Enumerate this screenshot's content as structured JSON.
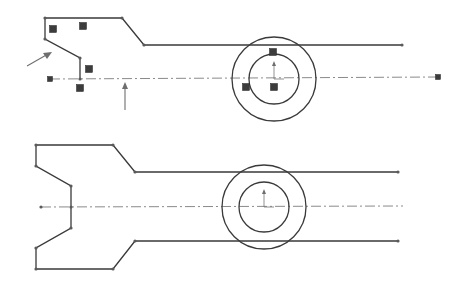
{
  "figure": {
    "colors": {
      "background": "#ffffff",
      "geometry": "#3a3a3a",
      "centerline": "#8a8a8a",
      "relation_badge": "#3c3c3c",
      "annotation_arrow": "#6e6e6e"
    },
    "top_sketch": {
      "polyline": [
        [
          45,
          18
        ],
        [
          122,
          18
        ],
        [
          144,
          45
        ],
        [
          402,
          45
        ]
      ],
      "left_chain": [
        [
          45,
          18
        ],
        [
          45,
          39
        ],
        [
          80,
          58
        ],
        [
          80,
          79
        ]
      ],
      "centerline": {
        "from": [
          50,
          79
        ],
        "to": [
          438,
          77
        ]
      },
      "circles": [
        {
          "cx": 274,
          "cy": 79,
          "r": 42
        },
        {
          "cx": 274,
          "cy": 79,
          "r": 25
        }
      ],
      "relation_badges": [
        [
          53,
          29
        ],
        [
          83,
          26
        ],
        [
          89,
          69
        ],
        [
          80,
          88
        ],
        [
          273,
          52
        ],
        [
          246,
          87
        ],
        [
          274,
          87
        ]
      ],
      "endpoint_squares": [
        [
          50,
          79
        ],
        [
          438,
          77
        ]
      ],
      "arrows": [
        {
          "from": [
            27,
            66
          ],
          "to": [
            50,
            53
          ]
        },
        {
          "from": [
            125,
            110
          ],
          "to": [
            125,
            84
          ]
        }
      ]
    },
    "bottom_sketch": {
      "outline": [
        [
          398,
          172
        ],
        [
          135,
          172
        ],
        [
          113,
          145
        ],
        [
          36,
          145
        ],
        [
          36,
          166
        ],
        [
          71,
          186
        ],
        [
          71,
          228
        ],
        [
          36,
          248
        ],
        [
          36,
          269
        ],
        [
          113,
          269
        ],
        [
          135,
          241
        ],
        [
          398,
          241
        ]
      ],
      "centerline": {
        "from": [
          41,
          207
        ],
        "to": [
          403,
          206
        ]
      },
      "circles": [
        {
          "cx": 264,
          "cy": 207,
          "r": 42
        },
        {
          "cx": 264,
          "cy": 207,
          "r": 25
        }
      ]
    }
  }
}
